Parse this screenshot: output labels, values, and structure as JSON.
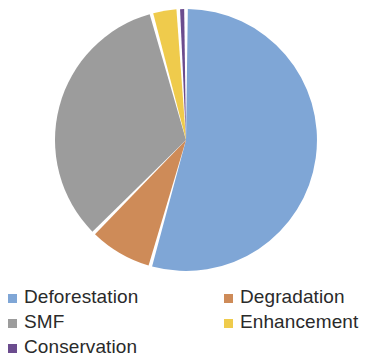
{
  "chart_data": {
    "type": "pie",
    "title": "",
    "subtitle": "",
    "xlabel": "",
    "ylabel": "",
    "grid": false,
    "legend_position": "bottom",
    "start_angle_deg": 0,
    "direction": "clockwise",
    "categories": [
      "Deforestation",
      "Degradation",
      "SMF",
      "Enhancement",
      "Conservation"
    ],
    "values": [
      54.4,
      8.1,
      33.3,
      3.3,
      0.9
    ],
    "unit": "percent",
    "colors": [
      "#7FA6D6",
      "#CE8B58",
      "#9C9C9C",
      "#EFCB4C",
      "#6B4C8E"
    ],
    "slices": [
      {
        "label": "Deforestation",
        "value": 54.4,
        "color": "#7FA6D6",
        "start_deg": 0,
        "end_deg": 195.8
      },
      {
        "label": "Degradation",
        "value": 8.1,
        "color": "#CE8B58",
        "start_deg": 195.8,
        "end_deg": 224.8
      },
      {
        "label": "SMF",
        "value": 33.3,
        "color": "#9C9C9C",
        "start_deg": 224.8,
        "end_deg": 344.7
      },
      {
        "label": "Enhancement",
        "value": 3.3,
        "color": "#EFCB4C",
        "start_deg": 344.7,
        "end_deg": 356.6
      },
      {
        "label": "Conservation",
        "value": 0.9,
        "color": "#6B4C8E",
        "start_deg": 356.6,
        "end_deg": 360.0
      }
    ]
  },
  "legend": {
    "rows": [
      {
        "left": {
          "label": "Deforestation",
          "color": "#7FA6D6",
          "visible": true
        },
        "right": {
          "label": "Degradation",
          "color": "#CE8B58",
          "visible": true
        }
      },
      {
        "left": {
          "label": "SMF",
          "color": "#9C9C9C",
          "visible": true
        },
        "right": {
          "label": "Enhancement",
          "color": "#EFCB4C",
          "visible": true
        }
      },
      {
        "left": {
          "label": "Conservation",
          "color": "#6B4C8E",
          "visible": true
        },
        "right": {
          "label": "",
          "color": "#FFFFFF",
          "visible": false
        }
      }
    ]
  },
  "geometry": {
    "center_x": 186,
    "center_y": 140,
    "radius": 131,
    "slice_gap_deg": 1.6,
    "background": "#FFFFFF"
  }
}
